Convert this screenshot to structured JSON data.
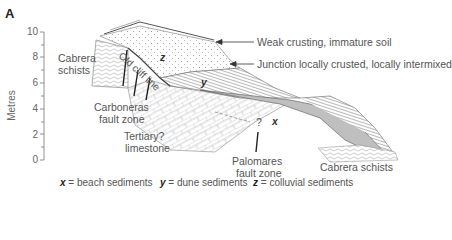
{
  "panel_label": "A",
  "axis": {
    "label": "Metres",
    "ticks": [
      "10",
      "8",
      "6",
      "4",
      "2",
      "0"
    ]
  },
  "labels": {
    "cabrera_left": "Cabrera\nschists",
    "cabrera_left_1": "Cabrera",
    "cabrera_left_2": "schists",
    "old_cliff_line": "Old cliff line",
    "z": "z",
    "y": "y",
    "x": "x",
    "weak_crusting": "Weak crusting, immature soil",
    "junction": "Junction locally crusted, locally intermixed",
    "carboneras_1": "Carboneras",
    "carboneras_2": "fault zone",
    "tertiary_1": "Tertiary?",
    "tertiary_2": "limestone",
    "question": "?",
    "palomares_1": "Palomares",
    "palomares_2": "fault zone",
    "cabrera_right": "Cabrera schists"
  },
  "legend": [
    {
      "symbol": "x",
      "text": " = beach sediments"
    },
    {
      "symbol": "y",
      "text": " = dune sediments"
    },
    {
      "symbol": "z",
      "text": " = colluvial sediments"
    }
  ]
}
